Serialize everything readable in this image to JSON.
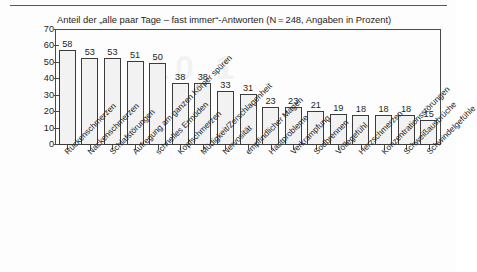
{
  "figure": {
    "watermark_text": "10.1",
    "top_rule": "horizontal-rule"
  },
  "chart_data": {
    "type": "bar",
    "title": "Anteil der „alle paar Tage – fast immer“-Antworten (N = 248, Angaben in Prozent)",
    "xlabel": "",
    "ylabel": "",
    "ylim": [
      0,
      70
    ],
    "yticks": [
      0,
      10,
      20,
      30,
      40,
      50,
      60,
      70
    ],
    "ytick_labels": [
      "0",
      "10",
      "20",
      "30",
      "40",
      "50",
      "60",
      "70"
    ],
    "grid": false,
    "legend": "none",
    "orientation": "vertical",
    "bar_fill": "#f2f2f2",
    "bar_edge": "#3b3b3b",
    "categories": [
      "Rückenschmerzen",
      "Nackenschmerzen",
      "Schlafstörungen",
      "Aufregung am ganzen Körper spüren",
      "schnelles Ermüden",
      "Kopfschmerzen",
      "Müdigkeit/Zerschlagenheit",
      "Nervosität",
      "empfindlicher Magen",
      "Hautprobleme",
      "Verkrampfung",
      "Sodbrennen",
      "Völlegefühl",
      "Herzschmerzen",
      "Konzentrationsstörungen",
      "Schweißausbrüche",
      "Schwindelgefühle"
    ],
    "values": [
      58,
      53,
      53,
      51,
      50,
      38,
      38,
      33,
      31,
      23,
      23,
      21,
      19,
      18,
      18,
      18,
      15
    ],
    "value_labels": [
      "58",
      "53",
      "53",
      "51",
      "50",
      "38",
      "38",
      "33",
      "31",
      "23",
      "23",
      "21",
      "19",
      "18",
      "18",
      "18",
      "15"
    ]
  }
}
